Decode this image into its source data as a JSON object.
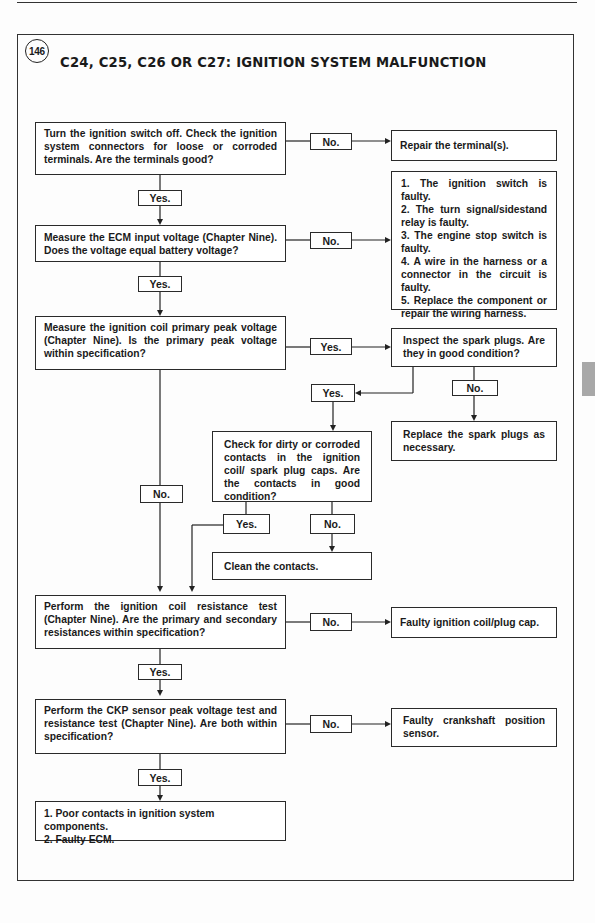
{
  "figure": {
    "number": "146",
    "title": "C24, C25, C26 OR C27: IGNITION SYSTEM MALFUNCTION"
  },
  "labels": {
    "yes": "Yes.",
    "no": "No."
  },
  "steps": {
    "s1": "Turn the ignition switch off. Check the ignition system connectors for loose or corroded terminals. Are the terminals good?",
    "s1_no_result": "Repair the terminal(s).",
    "s2": "Measure the ECM input voltage (Chapter Nine). Does the voltage equal battery voltage?",
    "s2_no_result": [
      "1. The ignition switch is faulty.",
      "2. The turn signal/sidestand relay is faulty.",
      "3. The engine stop switch is faulty.",
      "4. A wire in the harness or a connector in the circuit is faulty.",
      "5. Replace the component or repair the wiring harness."
    ],
    "s3": "Measure the ignition coil primary peak voltage (Chapter Nine). Is the primary peak voltage within specification?",
    "s3_yes_step": "Inspect the spark plugs. Are they in good condition?",
    "spark_no_result": "Replace the spark plugs as necessary.",
    "contacts_step": "Check for dirty or corroded contacts in the ignition coil/ spark plug caps. Are the contacts in good condition?",
    "contacts_no_result": "Clean the contacts.",
    "s4": "Perform the ignition coil resistance test (Chapter Nine). Are the primary and secondary resistances within specification?",
    "s4_no_result": "Faulty ignition coil/plug cap.",
    "s5": "Perform the CKP sensor peak voltage test and resistance test (Chapter Nine). Are both within specification?",
    "s5_no_result": "Faulty crankshaft position sensor.",
    "final_result": [
      "1. Poor contacts in ignition system components.",
      "2. Faulty ECM."
    ]
  },
  "colors": {
    "line": "#222222",
    "side_tab": "#a8a8a8"
  }
}
